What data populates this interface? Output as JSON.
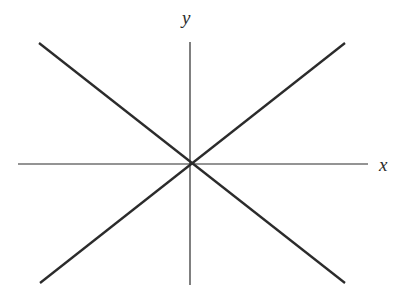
{
  "figure": {
    "background_color": "#ffffff",
    "width": 410,
    "height": 300,
    "stroke_color": "#2b2b2b"
  },
  "labels": {
    "x_axis": "x",
    "y_axis": "y"
  },
  "chart_data": {
    "type": "line",
    "title": "",
    "xlabel": "x",
    "ylabel": "y",
    "grid": false,
    "legend": null,
    "axes": {
      "origin_px": [
        190,
        164
      ],
      "x_axis_px": {
        "x1": 18,
        "y1": 164,
        "x2": 368,
        "y2": 164
      },
      "y_axis_px": {
        "x1": 190,
        "y1": 42,
        "x2": 190,
        "y2": 285
      },
      "axis_stroke_width": 1.2,
      "x_range_px": [
        18,
        368
      ],
      "y_range_px": [
        42,
        285
      ]
    },
    "series": [
      {
        "name": "rising-line",
        "description": "straight line through the origin with positive slope",
        "stroke_width": 2.3,
        "points_px": [
          [
            40,
            283
          ],
          [
            345,
            43
          ]
        ],
        "x": [
          -150,
          155
        ],
        "y": [
          -119,
          121
        ]
      },
      {
        "name": "falling-line",
        "description": "straight line through the origin with negative slope",
        "stroke_width": 2.3,
        "points_px": [
          [
            39,
            43
          ],
          [
            345,
            283
          ]
        ],
        "x": [
          -151,
          155
        ],
        "y": [
          121,
          -119
        ]
      }
    ],
    "annotations": [
      {
        "name": "y-axis-label",
        "text": "y",
        "x_px": 189,
        "y_px": 19
      },
      {
        "name": "x-axis-label",
        "text": "x",
        "x_px": 386,
        "y_px": 166
      }
    ]
  }
}
